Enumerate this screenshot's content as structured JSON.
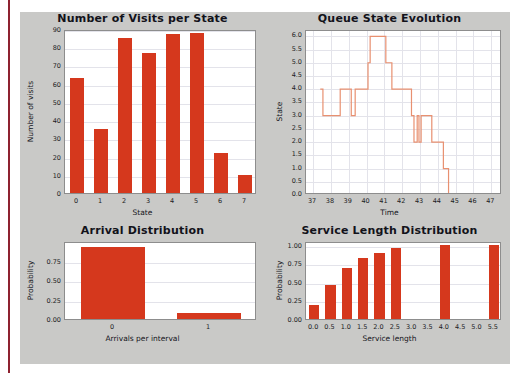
{
  "colors": {
    "bar": "#d5381d",
    "line": "#e89070",
    "panel": "#c9c9c7",
    "plot_bg": "#ffffff",
    "grid": "#e3e3ea",
    "margin_rule": "#8e2230"
  },
  "charts": {
    "visits": {
      "title": "Number of Visits per State",
      "xlabel": "State",
      "ylabel": "Number of visits",
      "yticks": [
        "0",
        "10",
        "20",
        "30",
        "40",
        "50",
        "60",
        "70",
        "80",
        "90"
      ],
      "xticks": [
        "0",
        "1",
        "2",
        "3",
        "4",
        "5",
        "6",
        "7"
      ]
    },
    "queue": {
      "title": "Queue State Evolution",
      "xlabel": "Time",
      "ylabel": "State",
      "yticks": [
        "0.0",
        "0.5",
        "1.0",
        "1.5",
        "2.0",
        "2.5",
        "3.0",
        "3.5",
        "4.0",
        "4.5",
        "5.0",
        "5.5",
        "6.0"
      ],
      "xticks": [
        "37",
        "38",
        "39",
        "40",
        "41",
        "42",
        "43",
        "44",
        "45",
        "46",
        "47"
      ]
    },
    "arrival": {
      "title": "Arrival Distribution",
      "xlabel": "Arrivals per interval",
      "ylabel": "Probability",
      "yticks": [
        "0.00",
        "0.25",
        "0.50",
        "0.75"
      ],
      "xticks": [
        "0",
        "1"
      ]
    },
    "service": {
      "title": "Service Length Distribution",
      "xlabel": "Service length",
      "ylabel": "Probability",
      "yticks": [
        "0.00",
        "0.25",
        "0.50",
        "0.75",
        "1.00"
      ],
      "xticks": [
        "0.0",
        "0.5",
        "1.0",
        "1.5",
        "2.0",
        "2.5",
        "3.0",
        "3.5",
        "4.0",
        "4.5",
        "5.0",
        "5.5"
      ]
    }
  },
  "chart_data": [
    {
      "type": "bar",
      "name": "visits",
      "title": "Number of Visits per State",
      "xlabel": "State",
      "ylabel": "Number of visits",
      "categories": [
        "0",
        "1",
        "2",
        "3",
        "4",
        "5",
        "6",
        "7"
      ],
      "values": [
        63,
        35,
        85,
        77,
        87,
        88,
        22,
        10
      ],
      "ylim": [
        0,
        90
      ],
      "ytick_values": [
        0,
        10,
        20,
        30,
        40,
        50,
        60,
        70,
        80,
        90
      ],
      "grid": true,
      "legend": "none",
      "color": "#d5381d"
    },
    {
      "type": "line",
      "name": "queue",
      "title": "Queue State Evolution",
      "xlabel": "Time",
      "ylabel": "State",
      "xlim": [
        36.6,
        47.6
      ],
      "ylim": [
        0.0,
        6.2
      ],
      "xtick_values": [
        37,
        38,
        39,
        40,
        41,
        42,
        43,
        44,
        45,
        46,
        47
      ],
      "ytick_values": [
        0.0,
        0.5,
        1.0,
        1.5,
        2.0,
        2.5,
        3.0,
        3.5,
        4.0,
        4.5,
        5.0,
        5.5,
        6.0
      ],
      "step": "post",
      "grid": true,
      "legend": "none",
      "color": "#e89070",
      "points": [
        {
          "x": 37.4,
          "y": 4
        },
        {
          "x": 37.55,
          "y": 3
        },
        {
          "x": 38.45,
          "y": 3
        },
        {
          "x": 38.52,
          "y": 4
        },
        {
          "x": 39.08,
          "y": 4
        },
        {
          "x": 39.14,
          "y": 3
        },
        {
          "x": 39.3,
          "y": 3
        },
        {
          "x": 39.36,
          "y": 4
        },
        {
          "x": 40.0,
          "y": 4
        },
        {
          "x": 40.08,
          "y": 5
        },
        {
          "x": 40.2,
          "y": 6
        },
        {
          "x": 41.0,
          "y": 6
        },
        {
          "x": 41.08,
          "y": 5
        },
        {
          "x": 41.35,
          "y": 5
        },
        {
          "x": 41.42,
          "y": 4
        },
        {
          "x": 42.45,
          "y": 4
        },
        {
          "x": 42.52,
          "y": 3
        },
        {
          "x": 42.62,
          "y": 3
        },
        {
          "x": 42.66,
          "y": 2
        },
        {
          "x": 42.8,
          "y": 2
        },
        {
          "x": 42.84,
          "y": 3
        },
        {
          "x": 42.9,
          "y": 3
        },
        {
          "x": 42.94,
          "y": 2
        },
        {
          "x": 43.02,
          "y": 2
        },
        {
          "x": 43.06,
          "y": 3
        },
        {
          "x": 43.6,
          "y": 3
        },
        {
          "x": 43.66,
          "y": 2
        },
        {
          "x": 44.25,
          "y": 2
        },
        {
          "x": 44.31,
          "y": 1
        },
        {
          "x": 44.55,
          "y": 1
        },
        {
          "x": 44.6,
          "y": 0
        },
        {
          "x": 47.55,
          "y": 0
        }
      ]
    },
    {
      "type": "bar",
      "name": "arrival",
      "title": "Arrival Distribution",
      "xlabel": "Arrivals per interval",
      "ylabel": "Probability",
      "categories": [
        "0",
        "1"
      ],
      "values": [
        0.92,
        0.08
      ],
      "ylim": [
        0.0,
        1.0
      ],
      "ytick_values": [
        0.0,
        0.25,
        0.5,
        0.75
      ],
      "grid": true,
      "legend": "none",
      "color": "#d5381d"
    },
    {
      "type": "bar",
      "name": "service",
      "title": "Service Length Distribution",
      "xlabel": "Service length",
      "ylabel": "Probability",
      "categories": [
        "0.0",
        "0.5",
        "1.0",
        "1.5",
        "2.0",
        "2.5",
        "3.0",
        "3.5",
        "4.0",
        "4.5",
        "5.0",
        "5.5"
      ],
      "values": [
        0.19,
        0.46,
        0.69,
        0.82,
        0.89,
        0.96,
        0,
        0,
        1.0,
        0,
        0,
        1.0
      ],
      "ylim": [
        0.0,
        1.05
      ],
      "ytick_values": [
        0.0,
        0.25,
        0.5,
        0.75,
        1.0
      ],
      "grid": true,
      "legend": "none",
      "color": "#d5381d"
    }
  ]
}
